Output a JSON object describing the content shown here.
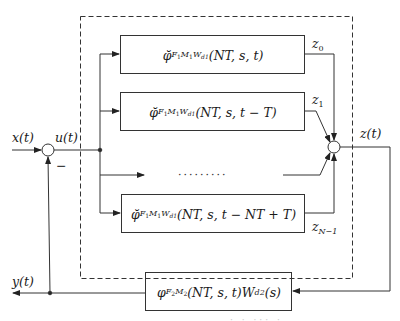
{
  "diagram": {
    "type": "block-diagram",
    "signals": {
      "input": "x(t)",
      "control": "u(t)",
      "output": "z(t)",
      "feedback": "y(t)",
      "z0": "z",
      "z0_sub": "0",
      "z1": "z",
      "z1_sub": "1",
      "zN1": "z",
      "zN1_sub": "N−1",
      "minus_sign": "−"
    },
    "blocks": [
      {
        "id": "block-1",
        "symbol": "φ̆",
        "subscript": "F₁M₁W",
        "subscript_parts": [
          "F",
          "1",
          "M",
          "1",
          "W",
          "d1"
        ],
        "args": "(NT, s, t)"
      },
      {
        "id": "block-2",
        "symbol": "φ̆",
        "subscript_parts": [
          "F",
          "1",
          "M",
          "1",
          "W",
          "d1"
        ],
        "args": "(NT, s, t − T)"
      },
      {
        "id": "block-N",
        "symbol": "φ̆",
        "subscript_parts": [
          "F",
          "1",
          "M",
          "1",
          "W",
          "d1"
        ],
        "args": "(NT, s, t − NT + T)"
      },
      {
        "id": "feedback-block",
        "symbol": "φ",
        "subscript_parts": [
          "F",
          "2",
          "M",
          "2"
        ],
        "args": "(NT, s, t)W",
        "suffix_sub": "d2",
        "suffix": "(s)"
      }
    ],
    "ellipsis": "·········",
    "caption_fragment": "· ·  ··· ·"
  }
}
